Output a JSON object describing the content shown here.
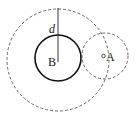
{
  "diagram": {
    "labels": {
      "d": "d",
      "B": "B",
      "A": "A"
    },
    "elements": [
      {
        "name": "outer-dashed-circle",
        "style": "dashed",
        "center": "B"
      },
      {
        "name": "circle-B",
        "style": "solid",
        "center": "B"
      },
      {
        "name": "circle-A",
        "style": "dashed",
        "center": "A"
      },
      {
        "name": "distance-segment-d",
        "style": "solid"
      },
      {
        "name": "point-A",
        "style": "small open circle"
      }
    ],
    "colors": {
      "stroke": "#222222",
      "dashed": "#555555",
      "background": "#ffffff"
    }
  }
}
